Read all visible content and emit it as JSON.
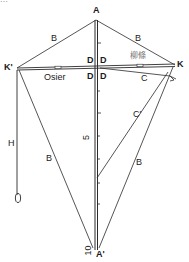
{
  "diagram": {
    "type": "kite-construction-diagram",
    "top_cropped_text": "…",
    "points": {
      "A": {
        "label": "A",
        "x": 96,
        "y": 10
      },
      "A_prime": {
        "label": "A'",
        "x": 96,
        "y": 252
      },
      "K_prime": {
        "label": "K'",
        "x": 15,
        "y": 69
      },
      "K": {
        "label": "K",
        "x": 176,
        "y": 66
      }
    },
    "labels": {
      "B_top_left": "B",
      "B_top_right": "B",
      "B_bottom_left": "B",
      "B_bottom_right": "B",
      "C": "C",
      "C_prime": "C'",
      "D_upper_left": "D",
      "D_upper_right": "D",
      "D_lower_left": "D",
      "D_lower_right": "D",
      "H": "H",
      "osier": "Osier",
      "willow_cjk": "柳條",
      "scale_5": "5",
      "scale_10": "10"
    },
    "colors": {
      "line": "#2a2a2a",
      "faint_line": "#555555",
      "cjk_text": "#777777",
      "background": "#ffffff"
    }
  }
}
